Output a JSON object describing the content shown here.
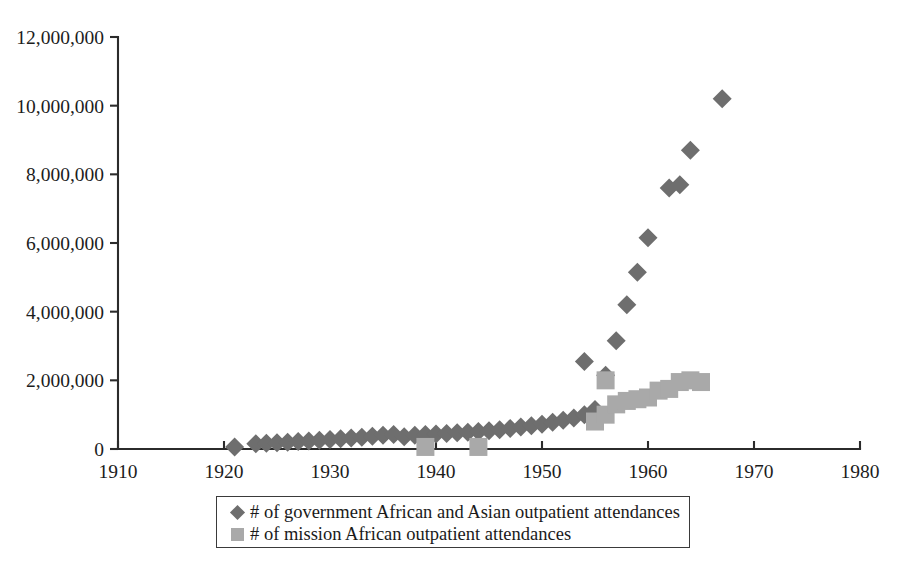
{
  "chart_data": {
    "type": "scatter",
    "title": "",
    "xlabel": "",
    "ylabel": "",
    "xlim": [
      1910,
      1980
    ],
    "ylim": [
      0,
      12000000
    ],
    "xticks": [
      1910,
      1920,
      1930,
      1940,
      1950,
      1960,
      1970,
      1980
    ],
    "yticks": [
      0,
      2000000,
      4000000,
      6000000,
      8000000,
      10000000,
      12000000
    ],
    "xtick_labels": [
      "1910",
      "1920",
      "1930",
      "1940",
      "1950",
      "1960",
      "1970",
      "1980"
    ],
    "ytick_labels": [
      "0",
      "2,000,000",
      "4,000,000",
      "6,000,000",
      "8,000,000",
      "10,000,000",
      "12,000,000"
    ],
    "grid": false,
    "legend_position": "bottom",
    "series": [
      {
        "name": "# of government African and Asian outpatient attendances",
        "marker": "diamond",
        "color": "#6e6e6e",
        "points": [
          [
            1921,
            60000
          ],
          [
            1923,
            150000
          ],
          [
            1924,
            170000
          ],
          [
            1925,
            185000
          ],
          [
            1926,
            200000
          ],
          [
            1927,
            215000
          ],
          [
            1928,
            235000
          ],
          [
            1929,
            255000
          ],
          [
            1930,
            275000
          ],
          [
            1931,
            295000
          ],
          [
            1932,
            320000
          ],
          [
            1933,
            345000
          ],
          [
            1934,
            375000
          ],
          [
            1935,
            400000
          ],
          [
            1936,
            420000
          ],
          [
            1937,
            360000
          ],
          [
            1938,
            400000
          ],
          [
            1939,
            420000
          ],
          [
            1940,
            440000
          ],
          [
            1941,
            455000
          ],
          [
            1942,
            470000
          ],
          [
            1943,
            490000
          ],
          [
            1944,
            510000
          ],
          [
            1945,
            535000
          ],
          [
            1946,
            560000
          ],
          [
            1947,
            600000
          ],
          [
            1948,
            640000
          ],
          [
            1949,
            680000
          ],
          [
            1950,
            720000
          ],
          [
            1951,
            780000
          ],
          [
            1952,
            840000
          ],
          [
            1953,
            900000
          ],
          [
            1954,
            1000000
          ],
          [
            1955,
            1150000
          ],
          [
            1954,
            2550000
          ],
          [
            1956,
            2150000
          ],
          [
            1957,
            3150000
          ],
          [
            1958,
            4200000
          ],
          [
            1959,
            5150000
          ],
          [
            1960,
            6150000
          ],
          [
            1962,
            7600000
          ],
          [
            1963,
            7700000
          ],
          [
            1964,
            8700000
          ],
          [
            1967,
            10200000
          ]
        ]
      },
      {
        "name": "# of mission African outpatient attendances",
        "marker": "square",
        "color": "#a9a9a9",
        "points": [
          [
            1939,
            60000
          ],
          [
            1944,
            60000
          ],
          [
            1955,
            800000
          ],
          [
            1956,
            1000000
          ],
          [
            1956,
            2000000
          ],
          [
            1957,
            1300000
          ],
          [
            1958,
            1400000
          ],
          [
            1959,
            1450000
          ],
          [
            1960,
            1500000
          ],
          [
            1961,
            1700000
          ],
          [
            1962,
            1750000
          ],
          [
            1963,
            1950000
          ],
          [
            1964,
            2000000
          ],
          [
            1965,
            1950000
          ]
        ]
      }
    ]
  },
  "legend": {
    "entries": [
      {
        "label": "# of government African and Asian outpatient attendances",
        "marker": "diamond-marker",
        "color": "#6e6e6e"
      },
      {
        "label": "# of mission African outpatient attendances",
        "marker": "square-marker",
        "color": "#a9a9a9"
      }
    ]
  }
}
